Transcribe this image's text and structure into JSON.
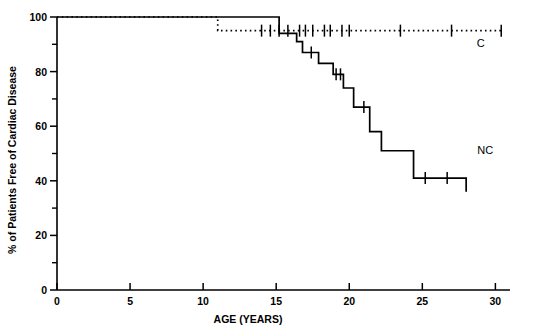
{
  "figure": {
    "title": "",
    "ylabel": "% of Patients Free of Cardiac Disease",
    "xlabel": "AGE (YEARS)",
    "series_labels": {
      "c": "C",
      "nc": "NC"
    }
  },
  "axes": {
    "x_ticks": [
      "0",
      "5",
      "10",
      "15",
      "20",
      "25",
      "30"
    ],
    "y_ticks": [
      "0",
      "20",
      "40",
      "60",
      "80",
      "100"
    ]
  },
  "chart_data": {
    "type": "line",
    "subtype": "kaplan-meier-step",
    "title": "",
    "xlabel": "AGE (YEARS)",
    "ylabel": "% of Patients Free of Cardiac Disease",
    "xlim": [
      0,
      31
    ],
    "ylim": [
      0,
      100
    ],
    "xticks": [
      0,
      5,
      10,
      15,
      20,
      25,
      30
    ],
    "yticks": [
      0,
      20,
      40,
      60,
      80,
      100
    ],
    "yticks_minor": [
      10,
      30,
      50,
      70,
      90
    ],
    "grid": false,
    "legend": "inline-end-labels",
    "series": [
      {
        "name": "C",
        "label": "C",
        "linestyle": "dotted",
        "color": "#000000",
        "steps": [
          {
            "x": 0.0,
            "y": 100
          },
          {
            "x": 11.0,
            "y": 100
          },
          {
            "x": 11.0,
            "y": 95
          },
          {
            "x": 30.4,
            "y": 95
          }
        ],
        "censor_marks": [
          14.0,
          14.6,
          15.2,
          15.8,
          16.6,
          17.0,
          17.5,
          18.3,
          18.7,
          19.5,
          20.0,
          23.5,
          27.0,
          30.4
        ]
      },
      {
        "name": "NC",
        "label": "NC",
        "linestyle": "solid",
        "color": "#000000",
        "steps": [
          {
            "x": 0.0,
            "y": 100
          },
          {
            "x": 15.2,
            "y": 100
          },
          {
            "x": 15.2,
            "y": 94
          },
          {
            "x": 16.4,
            "y": 94
          },
          {
            "x": 16.4,
            "y": 91
          },
          {
            "x": 16.8,
            "y": 91
          },
          {
            "x": 16.8,
            "y": 87
          },
          {
            "x": 17.9,
            "y": 87
          },
          {
            "x": 17.9,
            "y": 83
          },
          {
            "x": 18.9,
            "y": 83
          },
          {
            "x": 18.9,
            "y": 79
          },
          {
            "x": 19.6,
            "y": 79
          },
          {
            "x": 19.6,
            "y": 74
          },
          {
            "x": 20.3,
            "y": 74
          },
          {
            "x": 20.3,
            "y": 67
          },
          {
            "x": 21.4,
            "y": 67
          },
          {
            "x": 21.4,
            "y": 58
          },
          {
            "x": 22.2,
            "y": 58
          },
          {
            "x": 22.2,
            "y": 51
          },
          {
            "x": 24.4,
            "y": 51
          },
          {
            "x": 24.4,
            "y": 41
          },
          {
            "x": 28.0,
            "y": 41
          },
          {
            "x": 28.0,
            "y": 36
          }
        ],
        "censor_marks": [
          17.4,
          19.1,
          19.4,
          21.0,
          25.2,
          26.7
        ]
      }
    ],
    "annotations": [
      {
        "text": "C",
        "x": 29.0,
        "y": 89
      },
      {
        "text": "NC",
        "x": 29.3,
        "y": 50
      }
    ]
  }
}
